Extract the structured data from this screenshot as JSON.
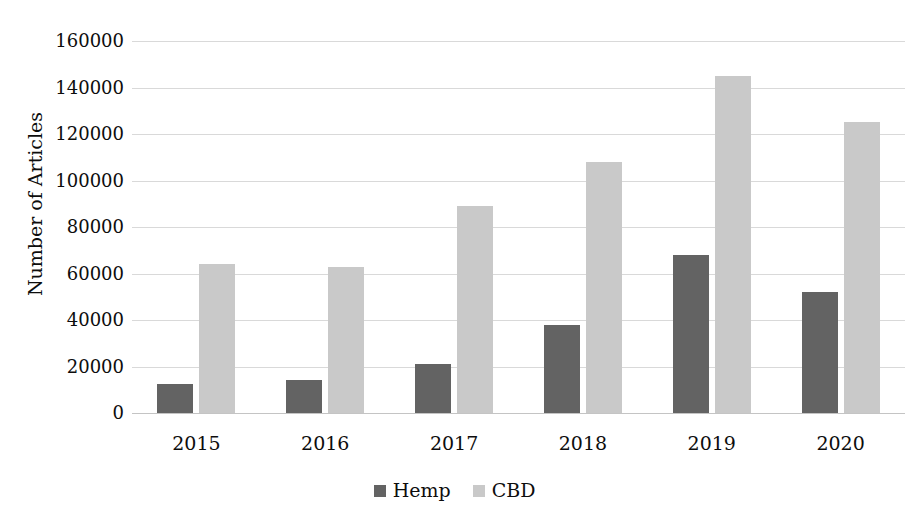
{
  "chart_data": {
    "type": "bar",
    "title": "",
    "xlabel": "",
    "ylabel": "Number of Articles",
    "categories": [
      "2015",
      "2016",
      "2017",
      "2018",
      "2019",
      "2020"
    ],
    "series": [
      {
        "name": "Hemp",
        "color": "#636363",
        "values": [
          12500,
          14000,
          21000,
          38000,
          68000,
          52000
        ]
      },
      {
        "name": "CBD",
        "color": "#c9c9c9",
        "values": [
          64000,
          63000,
          89000,
          108000,
          145000,
          125000
        ]
      }
    ],
    "ylim": [
      0,
      160000
    ],
    "ytick_values": [
      160000,
      140000,
      120000,
      100000,
      80000,
      60000,
      40000,
      20000,
      0
    ],
    "ytick_labels": [
      "160000",
      "140000",
      "120000",
      "100000",
      "80000",
      "60000",
      "40000",
      "20000",
      "0"
    ],
    "grid": true,
    "grid_axis": "y",
    "legend_position": "bottom",
    "legend_entries": [
      "Hemp",
      "CBD"
    ]
  },
  "axes": {
    "y_title": "Number of Articles"
  },
  "legend": {
    "items": [
      {
        "label": "Hemp",
        "swatch": "hemp-swatch-icon"
      },
      {
        "label": "CBD",
        "swatch": "cbd-swatch-icon"
      }
    ]
  },
  "header": {
    "title": ""
  }
}
